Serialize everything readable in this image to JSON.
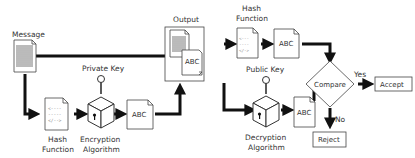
{
  "diagram": {
    "nodes": {
      "message": {
        "label": "Message"
      },
      "hash1": {
        "label_line1": "Hash",
        "label_line2": "Function"
      },
      "private_key": {
        "label": "Private Key"
      },
      "encryption": {
        "label_line1": "Encryption",
        "label_line2": "Algorithm"
      },
      "signature": {
        "label": "ABC"
      },
      "output": {
        "label": "Output",
        "inner_label": "ABC"
      },
      "hash2": {
        "label_line1": "Hash",
        "label_line2": "Function"
      },
      "digest": {
        "label": "ABC"
      },
      "public_key": {
        "label": "Public Key"
      },
      "decryption": {
        "label_line1": "Decryption",
        "label_line2": "Algorithm"
      },
      "decrypted": {
        "label": "ABC"
      },
      "compare": {
        "label": "Compare"
      },
      "accept": {
        "label": "Accept"
      },
      "reject": {
        "label": "Reject"
      }
    },
    "edges": {
      "yes": "Yes",
      "no": "No"
    },
    "colors": {
      "stroke": "#111111",
      "outline": "#444444",
      "text": "#333333",
      "background": "#ffffff"
    }
  }
}
